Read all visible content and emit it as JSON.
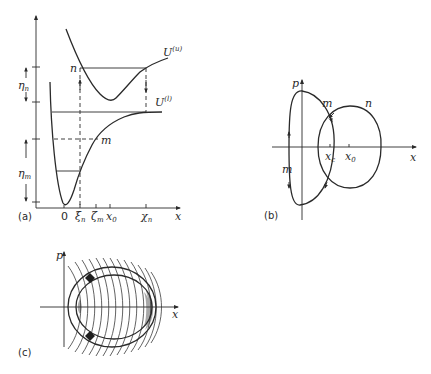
{
  "panel_a": {
    "tag": "(a)",
    "axis_x": "x",
    "curve_upper": "U",
    "curve_upper_sup": "(u)",
    "curve_lower": "U",
    "curve_lower_sup": "(l)",
    "level_n": "n",
    "level_m": "m",
    "eta": "η",
    "eta_n_sub": "n",
    "eta_m_sub": "m",
    "ticks": {
      "zero": "0",
      "xi": "ξ",
      "xi_sub": "n",
      "zeta": "ζ",
      "zeta_sub": "m",
      "x0": "x",
      "x0_sub": "0",
      "chi": "χ",
      "chi_sub": "n"
    }
  },
  "panel_b": {
    "tag": "(b)",
    "axis_x": "x",
    "axis_p": "p",
    "orbit_m_top": "m",
    "orbit_m_left": "m",
    "orbit_n": "n",
    "xc": "x",
    "xc_sub": "c",
    "x0": "x",
    "x0_sub": "0"
  },
  "panel_c": {
    "tag": "(c)",
    "axis_x": "x",
    "axis_p": "p"
  },
  "colors": {
    "ink": "#2a2a2a",
    "shade": "#a8a8a8",
    "background": "#ffffff"
  }
}
